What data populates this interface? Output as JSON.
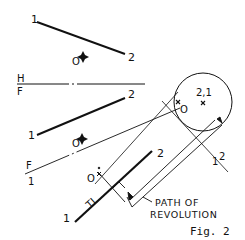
{
  "figure": {
    "caption": "Fig. 2",
    "annotation": {
      "line1": "PATH OF",
      "line2": "REVOLUTION"
    },
    "top_view": {
      "point1_label": "1",
      "point2_label": "2",
      "point_o_label": "O"
    },
    "folding_line_hf": {
      "upper_label": "H",
      "lower_label": "F"
    },
    "front_view": {
      "point1_label": "1",
      "point2_label": "2",
      "point_o_label": "O"
    },
    "folding_line_f1": {
      "upper_label": "F",
      "lower_label": "1"
    },
    "aux_view": {
      "point1_label": "1",
      "point2_label": "2",
      "point_o_label": "O",
      "true_length_label": "TL"
    },
    "point_view": {
      "label": "2,1",
      "point_o_label": "O",
      "edge_1_label": "1",
      "edge_2_label": "2"
    },
    "colors": {
      "line": "#111111",
      "background": "#ffffff"
    }
  }
}
